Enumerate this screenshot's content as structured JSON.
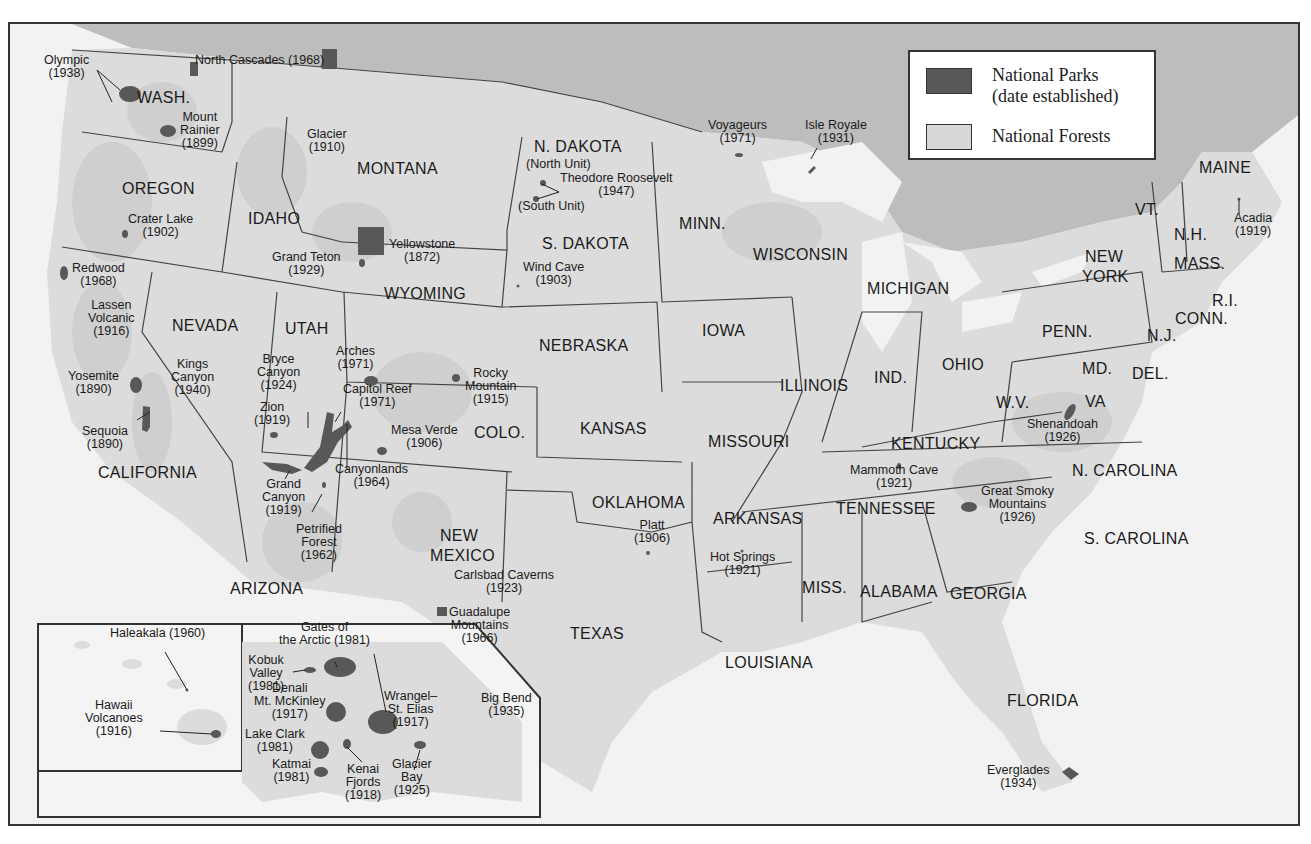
{
  "legend": {
    "items": [
      {
        "label_line1": "National Parks",
        "label_line2": "(date established)",
        "color": "#585858"
      },
      {
        "label_line1": "National Forests",
        "color": "#d8d8d8"
      }
    ]
  },
  "colors": {
    "canada": "#bdbdbd",
    "us_land": "#dcdcdc",
    "water": "#f2f2f2",
    "forest": "#cfcfcf",
    "park": "#585858",
    "border": "#444444"
  },
  "states": [
    {
      "name": "WASH.",
      "x": 135,
      "y": 97
    },
    {
      "name": "OREGON",
      "x": 120,
      "y": 188
    },
    {
      "name": "IDAHO",
      "x": 246,
      "y": 218
    },
    {
      "name": "MONTANA",
      "x": 355,
      "y": 168
    },
    {
      "name": "N. DAKOTA",
      "x": 532,
      "y": 146
    },
    {
      "name": "S. DAKOTA",
      "x": 540,
      "y": 243
    },
    {
      "name": "WYOMING",
      "x": 382,
      "y": 293
    },
    {
      "name": "NEVADA",
      "x": 170,
      "y": 325
    },
    {
      "name": "UTAH",
      "x": 283,
      "y": 328
    },
    {
      "name": "COLO.",
      "x": 472,
      "y": 432
    },
    {
      "name": "NEBRASKA",
      "x": 537,
      "y": 345
    },
    {
      "name": "KANSAS",
      "x": 578,
      "y": 428
    },
    {
      "name": "CALIFORNIA",
      "x": 96,
      "y": 472
    },
    {
      "name": "ARIZONA",
      "x": 228,
      "y": 588
    },
    {
      "name": "NEW",
      "x": 438,
      "y": 535
    },
    {
      "name": "MEXICO",
      "x": 428,
      "y": 555
    },
    {
      "name": "OKLAHOMA",
      "x": 590,
      "y": 502
    },
    {
      "name": "TEXAS",
      "x": 568,
      "y": 633
    },
    {
      "name": "MINN.",
      "x": 677,
      "y": 223
    },
    {
      "name": "WISCONSIN",
      "x": 751,
      "y": 254
    },
    {
      "name": "IOWA",
      "x": 700,
      "y": 330
    },
    {
      "name": "MICHIGAN",
      "x": 865,
      "y": 288
    },
    {
      "name": "ILLINOIS",
      "x": 778,
      "y": 385
    },
    {
      "name": "IND.",
      "x": 872,
      "y": 377
    },
    {
      "name": "OHIO",
      "x": 940,
      "y": 364
    },
    {
      "name": "MISSOURI",
      "x": 706,
      "y": 441
    },
    {
      "name": "KENTUCKY",
      "x": 889,
      "y": 443
    },
    {
      "name": "W.V.",
      "x": 994,
      "y": 402
    },
    {
      "name": "VA",
      "x": 1083,
      "y": 401
    },
    {
      "name": "MD.",
      "x": 1080,
      "y": 368
    },
    {
      "name": "DEL.",
      "x": 1130,
      "y": 373
    },
    {
      "name": "PENN.",
      "x": 1040,
      "y": 331
    },
    {
      "name": "N.J.",
      "x": 1145,
      "y": 335
    },
    {
      "name": "NEW",
      "x": 1083,
      "y": 256
    },
    {
      "name": "YORK",
      "x": 1080,
      "y": 276
    },
    {
      "name": "VT.",
      "x": 1133,
      "y": 209
    },
    {
      "name": "N.H.",
      "x": 1172,
      "y": 234
    },
    {
      "name": "MAINE",
      "x": 1197,
      "y": 167
    },
    {
      "name": "MASS.",
      "x": 1172,
      "y": 263
    },
    {
      "name": "R.I.",
      "x": 1210,
      "y": 300
    },
    {
      "name": "CONN.",
      "x": 1173,
      "y": 318
    },
    {
      "name": "ARKANSAS",
      "x": 711,
      "y": 518
    },
    {
      "name": "TENNESSEE",
      "x": 834,
      "y": 508
    },
    {
      "name": "N. CAROLINA",
      "x": 1070,
      "y": 470
    },
    {
      "name": "S. CAROLINA",
      "x": 1082,
      "y": 538
    },
    {
      "name": "MISS.",
      "x": 800,
      "y": 587
    },
    {
      "name": "ALABAMA",
      "x": 858,
      "y": 591
    },
    {
      "name": "GEORGIA",
      "x": 948,
      "y": 593
    },
    {
      "name": "LOUISIANA",
      "x": 723,
      "y": 662
    },
    {
      "name": "FLORIDA",
      "x": 1005,
      "y": 700
    }
  ],
  "parks": [
    {
      "lines": [
        "Olympic",
        "(1938)"
      ],
      "x": 42,
      "y": 60
    },
    {
      "lines": [
        "North Cascades (1968)"
      ],
      "x": 193,
      "y": 60
    },
    {
      "lines": [
        "Mount",
        "Rainier",
        "(1899)"
      ],
      "x": 178,
      "y": 117
    },
    {
      "lines": [
        "Glacier",
        "(1910)"
      ],
      "x": 305,
      "y": 134
    },
    {
      "lines": [
        "Crater Lake",
        "(1902)"
      ],
      "x": 126,
      "y": 219
    },
    {
      "lines": [
        "Grand Teton",
        "(1929)"
      ],
      "x": 270,
      "y": 257
    },
    {
      "lines": [
        "Yellowstone",
        "(1872)"
      ],
      "x": 387,
      "y": 244
    },
    {
      "lines": [
        "(North Unit)"
      ],
      "x": 524,
      "y": 164
    },
    {
      "lines": [
        "Theodore Roosevelt",
        "(1947)"
      ],
      "x": 558,
      "y": 178
    },
    {
      "lines": [
        "(South Unit)"
      ],
      "x": 516,
      "y": 206
    },
    {
      "lines": [
        "Wind Cave",
        "(1903)"
      ],
      "x": 521,
      "y": 267
    },
    {
      "lines": [
        "Redwood",
        "(1968)"
      ],
      "x": 70,
      "y": 268
    },
    {
      "lines": [
        "Lassen",
        "Volcanic",
        "(1916)"
      ],
      "x": 86,
      "y": 305
    },
    {
      "lines": [
        "Kings",
        "Canyon",
        "(1940)"
      ],
      "x": 169,
      "y": 364
    },
    {
      "lines": [
        "Yosemite",
        "(1890)"
      ],
      "x": 66,
      "y": 376
    },
    {
      "lines": [
        "Sequoia",
        "(1890)"
      ],
      "x": 80,
      "y": 431
    },
    {
      "lines": [
        "Bryce",
        "Canyon",
        "(1924)"
      ],
      "x": 255,
      "y": 359
    },
    {
      "lines": [
        "Arches",
        "(1971)"
      ],
      "x": 334,
      "y": 351
    },
    {
      "lines": [
        "Capitol Reef",
        "(1971)"
      ],
      "x": 341,
      "y": 389
    },
    {
      "lines": [
        "Zion",
        "(1919)"
      ],
      "x": 252,
      "y": 407
    },
    {
      "lines": [
        "Rocky",
        "Mountain",
        "(1915)"
      ],
      "x": 463,
      "y": 373
    },
    {
      "lines": [
        "Mesa Verde",
        "(1906)"
      ],
      "x": 389,
      "y": 430
    },
    {
      "lines": [
        "Canyonlands",
        "(1964)"
      ],
      "x": 333,
      "y": 469
    },
    {
      "lines": [
        "Grand",
        "Canyon",
        "(1919)"
      ],
      "x": 260,
      "y": 484
    },
    {
      "lines": [
        "Petrified",
        "Forest",
        "(1962)"
      ],
      "x": 294,
      "y": 529
    },
    {
      "lines": [
        "Carlsbad Caverns",
        "(1923)"
      ],
      "x": 452,
      "y": 575
    },
    {
      "lines": [
        "Guadalupe",
        "Mountains",
        "(1966)"
      ],
      "x": 447,
      "y": 612
    },
    {
      "lines": [
        "Big Bend",
        "(1935)"
      ],
      "x": 479,
      "y": 698
    },
    {
      "lines": [
        "Platt",
        "(1906)"
      ],
      "x": 632,
      "y": 525
    },
    {
      "lines": [
        "Hot Springs",
        "(1921)"
      ],
      "x": 708,
      "y": 557
    },
    {
      "lines": [
        "Voyageurs",
        "(1971)"
      ],
      "x": 706,
      "y": 125
    },
    {
      "lines": [
        "Isle Royale",
        "(1931)"
      ],
      "x": 803,
      "y": 125
    },
    {
      "lines": [
        "Mammoth Cave",
        "(1921)"
      ],
      "x": 848,
      "y": 470
    },
    {
      "lines": [
        "Shenandoah",
        "(1926)"
      ],
      "x": 1025,
      "y": 424
    },
    {
      "lines": [
        "Great Smoky",
        "Mountains",
        "(1926)"
      ],
      "x": 979,
      "y": 491
    },
    {
      "lines": [
        "Acadia",
        "(1919)"
      ],
      "x": 1232,
      "y": 218
    },
    {
      "lines": [
        "Everglades",
        "(1934)"
      ],
      "x": 985,
      "y": 770
    },
    {
      "lines": [
        "Haleakala (1960)"
      ],
      "x": 108,
      "y": 633
    },
    {
      "lines": [
        "Hawaii",
        "Volcanoes",
        "(1916)"
      ],
      "x": 83,
      "y": 705
    },
    {
      "lines": [
        "Gates of",
        "the Arctic (1981)"
      ],
      "x": 277,
      "y": 627
    },
    {
      "lines": [
        "Kobuk",
        "Valley",
        "(1981)"
      ],
      "x": 246,
      "y": 660
    },
    {
      "lines": [
        "Denali",
        "Mt. McKinley",
        "(1917)"
      ],
      "x": 252,
      "y": 688
    },
    {
      "lines": [
        "Wrangel–",
        "St. Elias",
        "(1917)"
      ],
      "x": 382,
      "y": 696
    },
    {
      "lines": [
        "Lake Clark",
        "(1981)"
      ],
      "x": 243,
      "y": 734
    },
    {
      "lines": [
        "Katmai",
        "(1981)"
      ],
      "x": 270,
      "y": 764
    },
    {
      "lines": [
        "Kenai",
        "Fjords",
        "(1918)"
      ],
      "x": 343,
      "y": 769
    },
    {
      "lines": [
        "Glacier",
        "Bay",
        "(1925)"
      ],
      "x": 390,
      "y": 764
    }
  ]
}
